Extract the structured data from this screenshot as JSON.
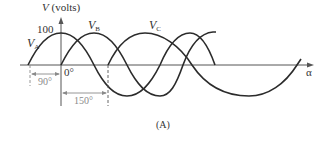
{
  "figure": {
    "caption": "(A)",
    "y_axis_label_var": "V",
    "y_axis_label_unit": "(volts)",
    "peak_label": "100",
    "x_axis_label": "α",
    "origin_label": "0°",
    "phase_markers": [
      {
        "label": "90°",
        "description": "V_A leads reference by 90°"
      },
      {
        "label": "150°",
        "description": "V_C lags reference by 150°"
      }
    ],
    "waveforms": [
      {
        "name": "V",
        "sub": "A",
        "phase_deg": 90
      },
      {
        "name": "V",
        "sub": "B",
        "phase_deg": 0
      },
      {
        "name": "V",
        "sub": "C",
        "phase_deg": -150
      }
    ],
    "colors": {
      "curve": "#2b2b2b",
      "axis": "#555555",
      "dimension": "#8a8a8a"
    }
  }
}
